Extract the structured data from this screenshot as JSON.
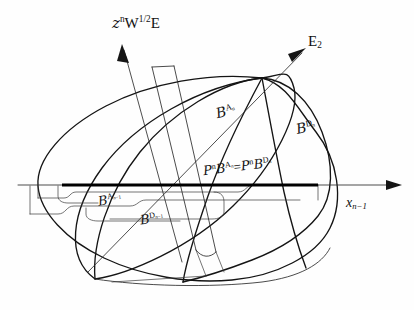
{
  "figure": {
    "kind": "hand-drawn-mathematical-diagram",
    "ink_color": "#141414",
    "background_color": "#ffffff",
    "bold_segment_color": "#000000"
  },
  "axes": [
    {
      "id": "axis-z",
      "label": "z",
      "sup": "n",
      "label2": "W",
      "sup2": "1/2",
      "label3": "E",
      "direction": "up-left",
      "has_arrow": true
    },
    {
      "id": "axis-e2",
      "label": "E",
      "sub": "2",
      "direction": "up-right",
      "has_arrow": true
    },
    {
      "id": "axis-x",
      "label": "x",
      "sub": "n−1",
      "direction": "right",
      "has_arrow": true
    }
  ],
  "labels": {
    "b_an": {
      "script": "B",
      "sup_a": "A",
      "sup_sub": "n"
    },
    "b_dn": {
      "script": "B",
      "sup_a": "D",
      "sup_sub": "n"
    },
    "proj_eq": {
      "p1": "P",
      "p1_sup": "n",
      "b1": "B",
      "b1_sup": "A",
      "b1_sup_sub": "n",
      "eq": "=",
      "p2": "P",
      "p2_sup": "n",
      "b2": "B",
      "b2_sup": "D",
      "b2_sup_sub": "n"
    },
    "b_anm1": {
      "script": "B",
      "sup_a": "A",
      "sup_sub": "n−1"
    },
    "b_dnm1": {
      "script": "B",
      "sup_a": "D",
      "sup_sub": "n−1"
    }
  }
}
